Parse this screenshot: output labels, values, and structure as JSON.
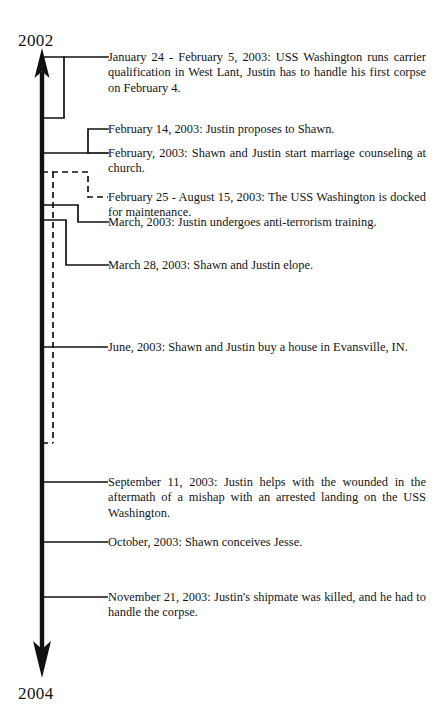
{
  "diagram": {
    "type": "vertical-timeline",
    "orientation": "top-to-bottom",
    "axis_start_label": "2002",
    "axis_end_label": "2004",
    "line_color": "#111111",
    "background_color": "#ffffff"
  },
  "axis": {
    "start_year": "2002",
    "end_year": "2004"
  },
  "events": [
    {
      "id": "jan-feb-2003-carrier-qual",
      "connector": "span-bracket",
      "style": "solid",
      "text": "January 24 - February 5, 2003:  USS Washington runs carrier qualification in West Lant, Justin has to handle his first corpse on February 4."
    },
    {
      "id": "feb-14-2003-proposal",
      "connector": "point",
      "style": "solid",
      "text": "February 14, 2003:  Justin proposes to Shawn."
    },
    {
      "id": "feb-2003-marriage-counseling",
      "connector": "point",
      "style": "solid",
      "text": "February, 2003:  Shawn and Justin start marriage counseling at church."
    },
    {
      "id": "feb-aug-2003-docked",
      "connector": "span-bracket",
      "style": "dashed",
      "text": "February 25 - August 15, 2003:  The USS Washington is docked for maintenance."
    },
    {
      "id": "mar-2003-anti-terrorism",
      "connector": "span-bracket",
      "style": "solid",
      "text": "March, 2003:  Justin undergoes anti-terrorism training."
    },
    {
      "id": "mar-28-2003-elope",
      "connector": "span-bracket",
      "style": "solid",
      "text": "March 28, 2003:  Shawn and Justin elope."
    },
    {
      "id": "jun-2003-house",
      "connector": "point",
      "style": "solid",
      "text": "June, 2003:  Shawn and Justin buy a house in Evansville, IN."
    },
    {
      "id": "sep-11-2003-mishap",
      "connector": "point",
      "style": "solid",
      "text": "September 11, 2003:  Justin helps with the wounded in the aftermath of a mishap with an arrested landing on the USS Washington."
    },
    {
      "id": "oct-2003-conceives",
      "connector": "point",
      "style": "solid",
      "text": "October, 2003: Shawn conceives Jesse."
    },
    {
      "id": "nov-21-2003-shipmate",
      "connector": "point",
      "style": "solid",
      "text": "November 21, 2003:  Justin's shipmate was killed, and he had to handle the corpse."
    }
  ]
}
